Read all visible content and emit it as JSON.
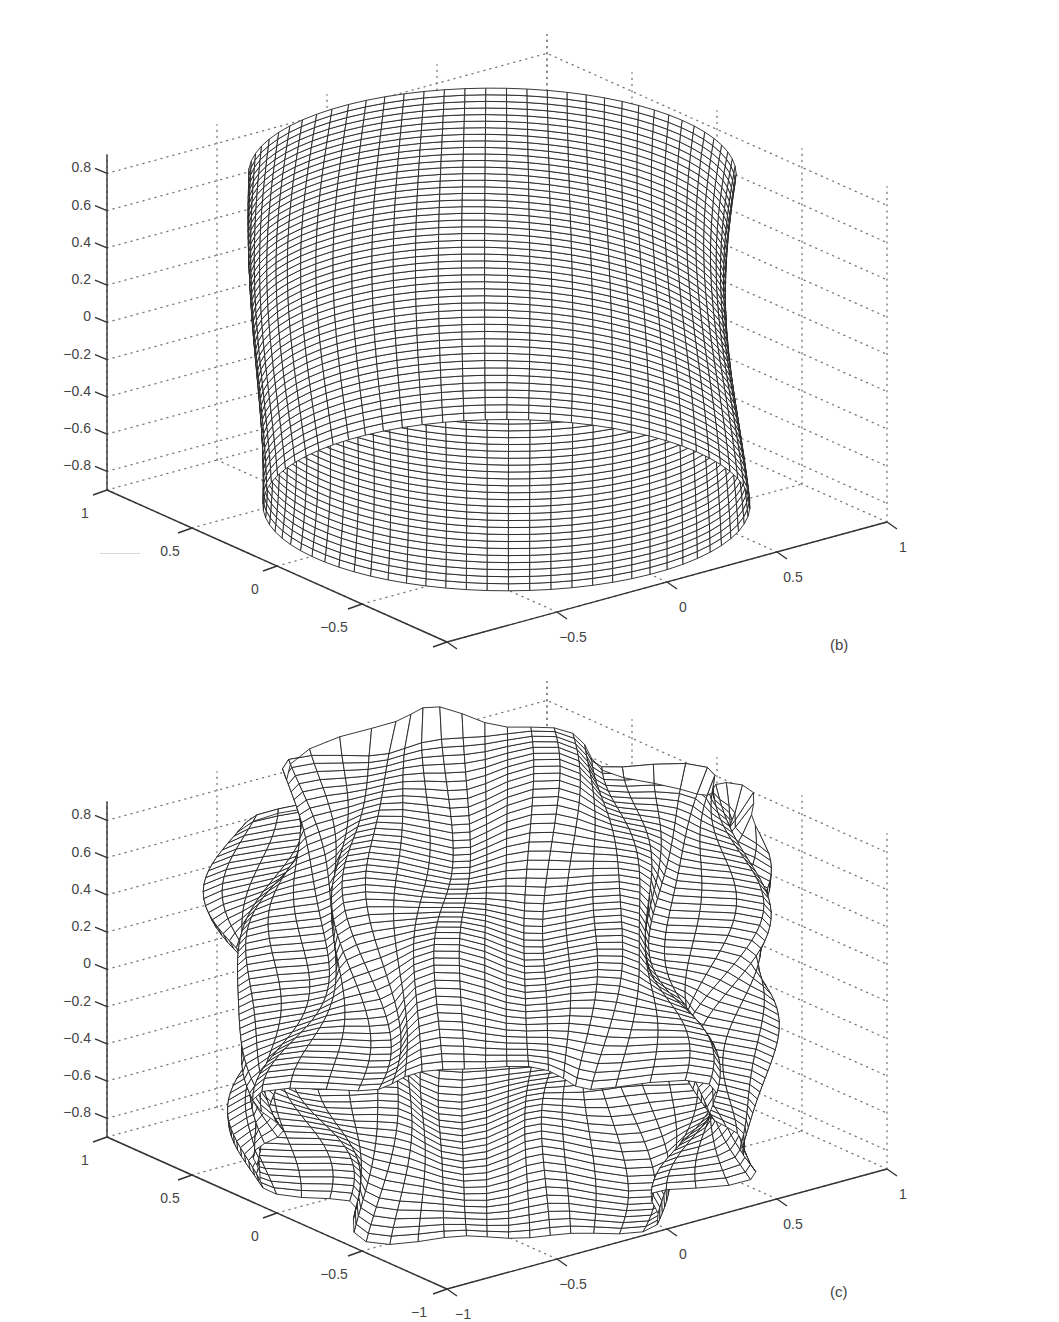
{
  "figure": {
    "panels": [
      {
        "id": "b",
        "label": "(b)",
        "description": "Smooth, slightly bulging cylindrical mesh surface"
      },
      {
        "id": "c",
        "label": "(c)",
        "description": "Strongly wrinkled / wavy cylindrical mesh surface"
      }
    ]
  },
  "chart_data": [
    {
      "type": "surface",
      "title": "",
      "panel_label": "(b)",
      "xlabel": "",
      "ylabel": "",
      "zlabel": "",
      "x_ticks": [
        "1",
        "0.5",
        "0",
        "−0.5",
        "−1"
      ],
      "y_ticks": [
        "−1",
        "−0.5",
        "0",
        "0.5",
        "1"
      ],
      "z_ticks": [
        "0.8",
        "0.6",
        "0.4",
        "0.2",
        "0",
        "−0.2",
        "−0.4",
        "−0.6",
        "−0.8"
      ],
      "xlim": [
        -1,
        1
      ],
      "ylim": [
        -1,
        1
      ],
      "zlim": [
        -0.9,
        0.9
      ],
      "grid": true,
      "grid_style": "dotted",
      "surface": {
        "shape": "cylinder",
        "radius_approx": 0.9,
        "z_range": [
          -0.9,
          0.9
        ],
        "deformation": "smooth low-amplitude bulge",
        "mesh_color": "#222222",
        "face_color": "#ffffff"
      }
    },
    {
      "type": "surface",
      "title": "",
      "panel_label": "(c)",
      "xlabel": "",
      "ylabel": "",
      "zlabel": "",
      "x_ticks": [
        "1",
        "0.5",
        "0",
        "−0.5",
        "−1"
      ],
      "y_ticks": [
        "−1",
        "−0.5",
        "0",
        "0.5",
        "1"
      ],
      "z_ticks": [
        "0.8",
        "0.6",
        "0.4",
        "0.2",
        "0",
        "−0.2",
        "−0.4",
        "−0.6",
        "−0.8"
      ],
      "xlim": [
        -1,
        1
      ],
      "ylim": [
        -1,
        1
      ],
      "zlim": [
        -0.9,
        0.9
      ],
      "grid": true,
      "grid_style": "dotted",
      "surface": {
        "shape": "cylinder",
        "radius_approx": 0.9,
        "z_range": [
          -0.9,
          0.9
        ],
        "deformation": "high-frequency wrinkles / folds",
        "mesh_color": "#222222",
        "face_color": "#ffffff"
      }
    }
  ],
  "colors": {
    "axis": "#333333",
    "grid": "#777777",
    "mesh": "#222222",
    "text": "#444444"
  }
}
